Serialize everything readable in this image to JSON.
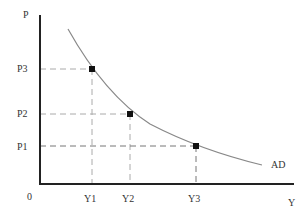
{
  "diagram": {
    "type": "aggregate-demand-curve",
    "axes": {
      "y_label": "P",
      "x_label": "Y",
      "origin_label": "0"
    },
    "curve_label": "AD",
    "price_levels": [
      "P3",
      "P2",
      "P1"
    ],
    "output_levels": [
      "Y1",
      "Y2",
      "Y3"
    ],
    "points": [
      {
        "price": "P3",
        "output": "Y1"
      },
      {
        "price": "P2",
        "output": "Y2"
      },
      {
        "price": "P1",
        "output": "Y3"
      }
    ],
    "colors": {
      "axis": "#222222",
      "curve": "#888888",
      "guide": "#aaaaaa",
      "marker": "#111111"
    }
  }
}
